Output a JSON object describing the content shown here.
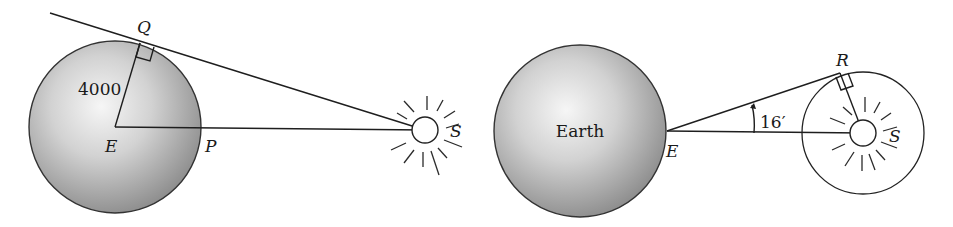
{
  "figure": {
    "left_panel": {
      "earth_label_center": "E",
      "tangent_point_label": "Q",
      "surface_point_label": "P",
      "sun_label": "S",
      "radius_label": "4000",
      "right_angle_at": "Q"
    },
    "right_panel": {
      "earth_label": "Earth",
      "observer_label": "E",
      "tangent_point_label": "R",
      "sun_label": "S",
      "angle_label": "16′",
      "right_angle_at": "R"
    },
    "colors": {
      "ink": "#1e1e1e",
      "sphere_light": "#f4f4f4",
      "sphere_dark": "#8a8a8a",
      "background": "#ffffff"
    }
  }
}
